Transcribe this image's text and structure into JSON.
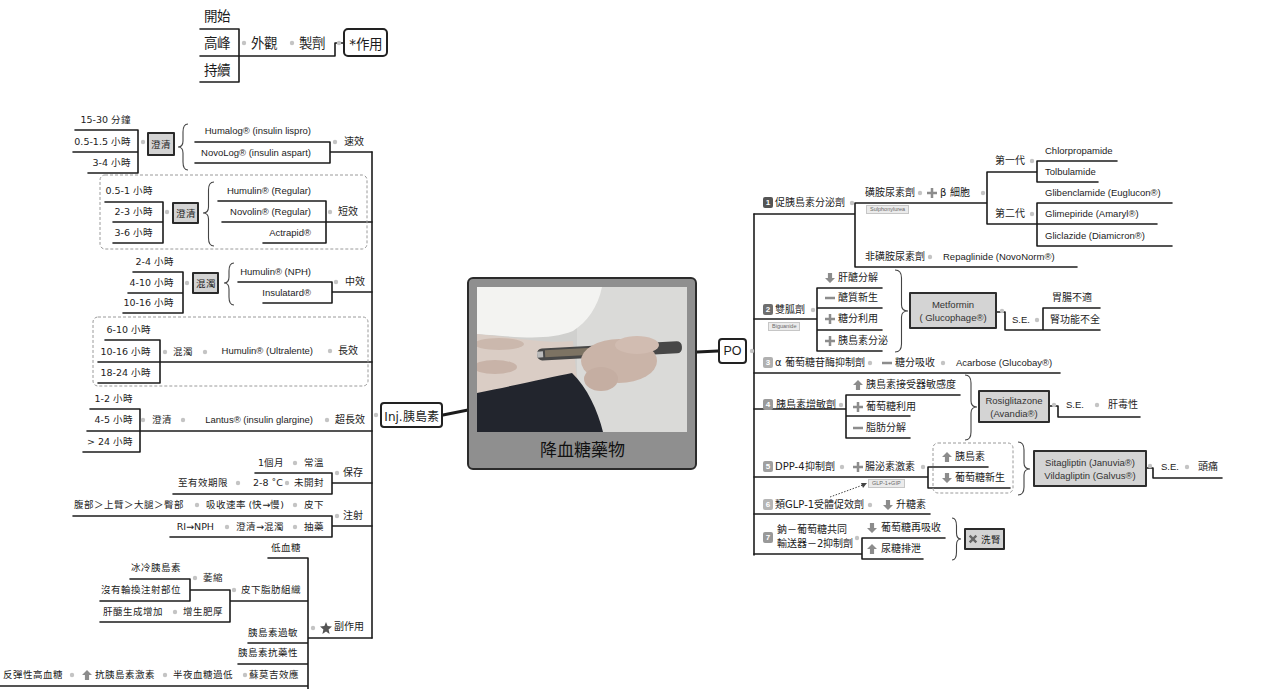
{
  "legend": {
    "timing": [
      "開始",
      "高峰",
      "持續"
    ],
    "appearance": "外觀",
    "formulation": "製劑",
    "action": "*作用"
  },
  "central_topic": {
    "title": "降血糖藥物"
  },
  "injection": {
    "label": "Inj.胰島素",
    "types": [
      {
        "action": "速效",
        "appearance": "澄清",
        "timing": [
          "15-30 分鐘",
          "0.5-1.5 小時",
          "3-4 小時"
        ],
        "drugs": [
          "Humalog® (insulin lispro)",
          "NovoLog® (insulin aspart)"
        ]
      },
      {
        "action": "短效",
        "appearance": "澄清",
        "timing": [
          "0.5-1 小時",
          "2-3 小時",
          "3-6 小時"
        ],
        "drugs": [
          "Humulin® (Regular)",
          "Novolin® (Regular)",
          "Actrapid®"
        ]
      },
      {
        "action": "中效",
        "appearance": "混濁",
        "timing": [
          "2-4 小時",
          "4-10 小時",
          "10-16 小時"
        ],
        "drugs": [
          "Humulin® (NPH)",
          "Insulatard®"
        ]
      },
      {
        "action": "長效",
        "appearance": "混濁",
        "timing": [
          "6-10 小時",
          "10-16 小時",
          "18-24 小時"
        ],
        "drugs": [
          "Humulin® (Ultralente)"
        ]
      },
      {
        "action": "超長效",
        "appearance": "澄清",
        "timing": [
          "1-2 小時",
          "4-5 小時",
          "> 24 小時"
        ],
        "drugs": [
          "Lantus® (insulin glargine)"
        ]
      }
    ],
    "storage": {
      "label": "保存",
      "items": [
        {
          "condition": "常溫",
          "duration": "1個月"
        },
        {
          "condition": "未開封",
          "temperature": "2-8 ˚C",
          "duration": "至有效期限"
        }
      ]
    },
    "administration": {
      "label": "注射",
      "items": [
        {
          "route": "皮下",
          "note": "吸收速率 (快→慢)",
          "detail": "腹部＞上臂＞大腿＞臀部"
        },
        {
          "route": "抽藥",
          "note": "澄清→混濁",
          "detail": "RI→NPH"
        }
      ]
    },
    "side_effects": {
      "label": "副作用",
      "icon": "star",
      "items": {
        "hypoglycemia": "低血糖",
        "lipodystrophy": {
          "label": "皮下脂肪組織",
          "atrophy": {
            "label": "萎縮",
            "causes": [
              "冰冷胰島素",
              "沒有輪換注射部位"
            ]
          },
          "hypertrophy": {
            "label": "增生肥厚",
            "cause": "肝醣生成增加"
          }
        },
        "allergy": "胰島素過敏",
        "resistance": "胰島素抗藥性",
        "somogyi": {
          "label": "蘇莫吉效應",
          "cause": "半夜血糖過低",
          "mechanism": "抗胰島素激素",
          "mechanism_icon": "up-arrow",
          "result": "反彈性高血糖"
        }
      }
    }
  },
  "oral": {
    "label": "PO",
    "classes": [
      {
        "number": "1",
        "label": "促胰島素分泌劑",
        "sulfonylurea": {
          "label": "磺胺尿素劑",
          "tag": "Sulphonylurea",
          "mechanism_icon": "plus",
          "mechanism": "β 細胞",
          "generations": [
            {
              "label": "第一代",
              "drugs": [
                "Chlorpropamide",
                "Tolbulamide"
              ]
            },
            {
              "label": "第二代",
              "drugs": [
                "Glibenclamide (Euglucon®)",
                "Glimepiride (Amaryl®)",
                "Gliclazide (Diamicron®)"
              ]
            }
          ]
        },
        "non_sulfonylurea": {
          "label": "非磺胺尿素劑",
          "drug": "Repaglinide (NovoNorm®)"
        }
      },
      {
        "number": "2",
        "label": "雙胍劑",
        "tag": "Biguanide",
        "effects": [
          {
            "icon": "down-arrow",
            "text": "肝醣分解"
          },
          {
            "icon": "minus",
            "text": "醣質新生"
          },
          {
            "icon": "plus",
            "text": "糖分利用"
          },
          {
            "icon": "plus",
            "text": "胰島素分泌"
          }
        ],
        "drug": [
          "Metformin",
          "( Glucophage®)"
        ],
        "se_label": "S.E.",
        "side_effects": [
          "胃腸不適",
          "腎功能不全"
        ]
      },
      {
        "number": "3",
        "label": "α 葡萄糖苷酶抑制劑",
        "effect": {
          "icon": "minus",
          "text": "糖分吸收"
        },
        "drug": "Acarbose (Glucobay®)"
      },
      {
        "number": "4",
        "label": "胰島素增敏劑",
        "effects": [
          {
            "icon": "up-arrow",
            "text": "胰島素接受器敏感度"
          },
          {
            "icon": "plus",
            "text": "葡萄糖利用"
          },
          {
            "icon": "minus",
            "text": "脂肪分解"
          }
        ],
        "drug": [
          "Rosiglitazone",
          "(Avandia®)"
        ],
        "se_label": "S.E.",
        "side_effects": [
          "肝毒性"
        ]
      },
      {
        "number": "5",
        "label": "DPP-4抑制劑",
        "mechanism_icon": "plus",
        "mechanism": "腸泌素激素",
        "tag": "GLP-1+GIP",
        "effects": [
          {
            "icon": "up-arrow",
            "text": "胰島素"
          },
          {
            "icon": "down-arrow",
            "text": "葡萄糖新生"
          }
        ],
        "drugs": [
          "Sitagliptin (Januvia®)",
          "Vildagliptin (Galvus®)"
        ],
        "se_label": "S.E.",
        "side_effects": [
          "頭痛"
        ]
      },
      {
        "number": "6",
        "label": "類GLP-1受體促效劑",
        "effect": {
          "icon": "down-arrow",
          "text": "升糖素"
        }
      },
      {
        "number": "7",
        "label": [
          "鈉－葡萄糖共同",
          "輸送器－2抑制劑"
        ],
        "effects": [
          {
            "icon": "down-arrow",
            "text": "葡萄糖再吸收"
          },
          {
            "icon": "up-arrow",
            "text": "尿糖排泄"
          }
        ],
        "outcome": {
          "icon": "x-mark",
          "text": "洗腎"
        }
      }
    ]
  },
  "colors": {
    "line": "#1c1c1c",
    "highlight_node_fill": "#d3d3d3",
    "central_fill": "#8f8f8f",
    "icon": "#8c8c8c",
    "connector_dot": "#c4c4c4",
    "badges": [
      "#555555",
      "#6e6e6e",
      "#b0b0b0",
      "#9a9a9a",
      "#a0a0a0",
      "#b5b5b5",
      "#999999"
    ]
  }
}
